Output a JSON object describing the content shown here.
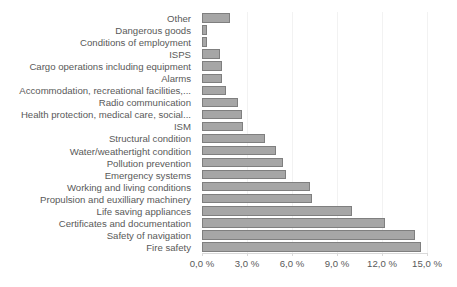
{
  "chart_data": {
    "type": "bar",
    "orientation": "horizontal",
    "title": "",
    "subtitle": "",
    "xlabel": "",
    "ylabel": "",
    "xlim": [
      0,
      15
    ],
    "xticks": [
      0,
      3,
      6,
      9,
      12,
      15
    ],
    "xtick_labels": [
      "0,0 %",
      "3,0 %",
      "6,0 %",
      "9,0 %",
      "12,0 %",
      "15,0 %"
    ],
    "grid": true,
    "legend": "none",
    "bar_color": "#a6a6a6",
    "bar_border_color": "#7f7f7f",
    "gridline_color": "#f2f2f2",
    "axis_color": "#d9d9d9",
    "text_color": "#595959",
    "unit": "%",
    "categories": [
      "Other",
      "Dangerous goods",
      "Conditions of employment",
      "ISPS",
      "Cargo operations including equipment",
      "Alarms",
      "Accommodation, recreational facilities,...",
      "Radio communication",
      "Health protection, medical care, social...",
      "ISM",
      "Structural condition",
      "Water/weathertight condition",
      "Pollution prevention",
      "Emergency systems",
      "Working and living conditions",
      "Propulsion and euxilliary machinery",
      "Life saving appliances",
      "Certificates and documentation",
      "Safety of navigation",
      "Fire safety"
    ],
    "values": [
      1.85,
      0.3,
      0.35,
      1.2,
      1.35,
      1.35,
      1.6,
      2.4,
      2.65,
      2.75,
      4.2,
      4.9,
      5.4,
      5.6,
      7.2,
      7.35,
      10.0,
      12.2,
      14.2,
      14.6
    ]
  }
}
